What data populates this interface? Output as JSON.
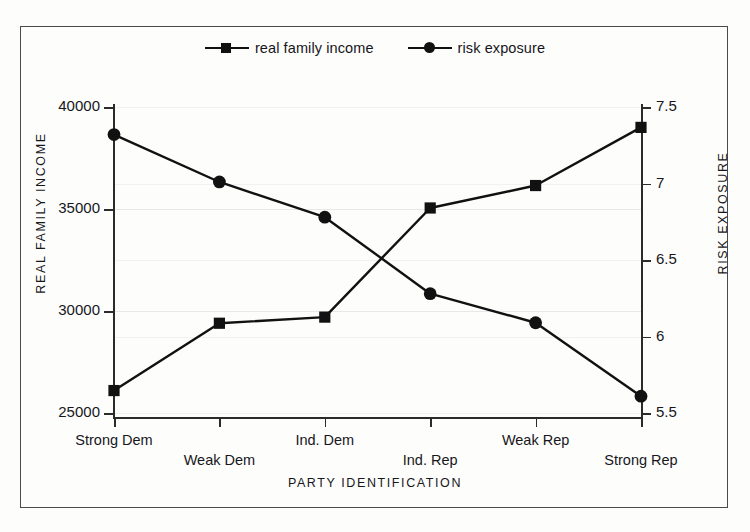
{
  "chart_data": {
    "type": "line",
    "title": "",
    "xlabel": "PARTY IDENTIFICATION",
    "categories": [
      "Strong Dem",
      "Weak Dem",
      "Ind. Dem",
      "Ind. Rep",
      "Weak Rep",
      "Strong Rep"
    ],
    "grid": true,
    "legend_position": "top-center",
    "axes": {
      "left": {
        "label": "REAL FAMILY INCOME",
        "ticks": [
          25000,
          30000,
          35000,
          40000
        ],
        "tick_labels": [
          "25000",
          "30000",
          "35000",
          "40000"
        ],
        "ylim": [
          25000,
          40000
        ]
      },
      "right": {
        "label": "RISK EXPOSURE",
        "ticks": [
          5.5,
          6,
          6.5,
          7,
          7.5
        ],
        "tick_labels": [
          "5.5",
          "6",
          "6.5",
          "7",
          "7.5"
        ],
        "ylim": [
          5.5,
          7.5
        ]
      }
    },
    "series": [
      {
        "name": "real family income",
        "axis": "left",
        "marker": "square",
        "color": "#111111",
        "values": [
          26100,
          29400,
          29700,
          35050,
          36150,
          39000
        ]
      },
      {
        "name": "risk exposure",
        "axis": "right",
        "marker": "circle",
        "color": "#111111",
        "values": [
          7.32,
          7.01,
          6.78,
          6.28,
          6.09,
          5.61
        ]
      }
    ]
  },
  "legend": {
    "entries": [
      {
        "label": "real family income",
        "marker": "square-marker-icon"
      },
      {
        "label": "risk exposure",
        "marker": "circle-marker-icon"
      }
    ]
  },
  "colors": {
    "ink": "#111111",
    "frame": "#4a4a4a",
    "grid": "#e8e8ea",
    "background": "#fdfdfc"
  }
}
